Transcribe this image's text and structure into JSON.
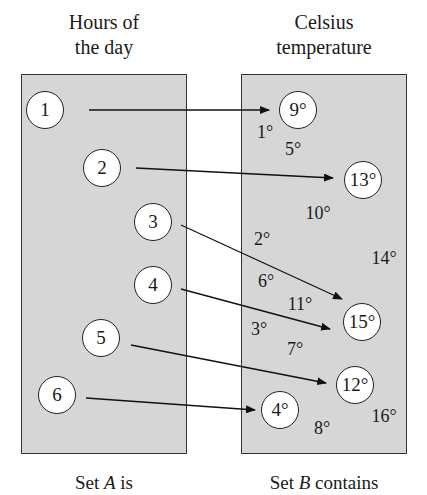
{
  "headings": {
    "set_a": [
      "Hours of",
      "the day"
    ],
    "set_b": [
      "Celsius",
      "temperature"
    ]
  },
  "set_a": {
    "elements": [
      {
        "label": "1",
        "x": 45,
        "y": 110
      },
      {
        "label": "2",
        "x": 102,
        "y": 168
      },
      {
        "label": "3",
        "x": 153,
        "y": 222
      },
      {
        "label": "4",
        "x": 153,
        "y": 285
      },
      {
        "label": "5",
        "x": 101,
        "y": 338
      },
      {
        "label": "6",
        "x": 57,
        "y": 395
      }
    ]
  },
  "set_b": {
    "circled": [
      {
        "label": "9°",
        "x": 298,
        "y": 110
      },
      {
        "label": "13°",
        "x": 363,
        "y": 180
      },
      {
        "label": "15°",
        "x": 362,
        "y": 322
      },
      {
        "label": "12°",
        "x": 355,
        "y": 385
      },
      {
        "label": "4°",
        "x": 280,
        "y": 410
      }
    ],
    "loose": [
      {
        "label": "1°",
        "x": 265,
        "y": 132
      },
      {
        "label": "5°",
        "x": 293,
        "y": 149
      },
      {
        "label": "10°",
        "x": 318,
        "y": 213
      },
      {
        "label": "2°",
        "x": 262,
        "y": 239
      },
      {
        "label": "14°",
        "x": 384,
        "y": 258
      },
      {
        "label": "6°",
        "x": 266,
        "y": 281
      },
      {
        "label": "11°",
        "x": 300,
        "y": 304
      },
      {
        "label": "3°",
        "x": 259,
        "y": 329
      },
      {
        "label": "7°",
        "x": 295,
        "y": 349
      },
      {
        "label": "16°",
        "x": 384,
        "y": 416
      },
      {
        "label": "8°",
        "x": 322,
        "y": 428
      }
    ]
  },
  "mapping": [
    {
      "from": "1",
      "to": "9°"
    },
    {
      "from": "2",
      "to": "13°"
    },
    {
      "from": "3",
      "to": "15°"
    },
    {
      "from": "4",
      "to": "15°"
    },
    {
      "from": "5",
      "to": "12°"
    },
    {
      "from": "6",
      "to": "4°"
    }
  ],
  "captions": {
    "set_a": "Set A is",
    "set_a_var": "A",
    "set_b": "Set B contains",
    "set_b_var": "B"
  }
}
